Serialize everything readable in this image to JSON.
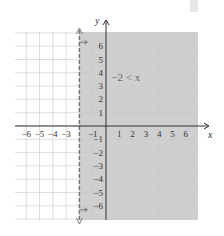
{
  "chart_data": {
    "type": "area",
    "title": "",
    "inequality": "-2 < x",
    "boundary": {
      "type": "vertical",
      "x": -2,
      "style": "dashed"
    },
    "shaded_region": "x > -2",
    "xlabel": "x",
    "ylabel": "y",
    "xlim": [
      -7,
      7
    ],
    "ylim": [
      -7,
      7
    ],
    "grid": true,
    "x_ticks": [
      -6,
      -5,
      -4,
      -3,
      -1,
      1,
      2,
      3,
      4,
      5,
      6
    ],
    "x_tick_labels": [
      "−6",
      "−5",
      "−4",
      "−3",
      "−1",
      "1",
      "2",
      "3",
      "4",
      "5",
      "6"
    ],
    "y_ticks": [
      6,
      5,
      4,
      3,
      2,
      1,
      -1,
      -2,
      -3,
      -4,
      -5,
      -6
    ],
    "y_tick_labels": [
      "6",
      "5",
      "4",
      "3",
      "2",
      "1",
      "−1",
      "−2",
      "−3",
      "−4",
      "−5",
      "−6"
    ],
    "colors": {
      "shade": "#cfcfcf",
      "grid": "#c8c8c8",
      "axis": "#333333",
      "boundary": "#777777"
    }
  },
  "labels": {
    "x_axis": "x",
    "y_axis": "y",
    "inequality": "−2 < x"
  }
}
